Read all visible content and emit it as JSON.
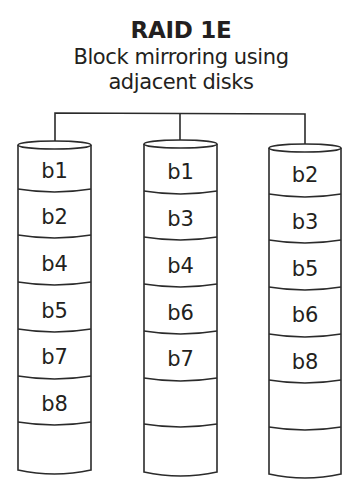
{
  "title": "RAID 1E",
  "subtitle_line1": "Block mirroring using",
  "subtitle_line2": "adjacent disks",
  "colors": {
    "stroke": "#2b2b2b",
    "text": "#231f20",
    "background": "#ffffff"
  },
  "disks": [
    {
      "name": "disk-1",
      "blocks": [
        "b1",
        "b2",
        "b4",
        "b5",
        "b7",
        "b8",
        ""
      ]
    },
    {
      "name": "disk-2",
      "blocks": [
        "b1",
        "b3",
        "b4",
        "b6",
        "b7",
        "",
        ""
      ]
    },
    {
      "name": "disk-3",
      "blocks": [
        "b2",
        "b3",
        "b5",
        "b6",
        "b8",
        "",
        ""
      ]
    }
  ]
}
